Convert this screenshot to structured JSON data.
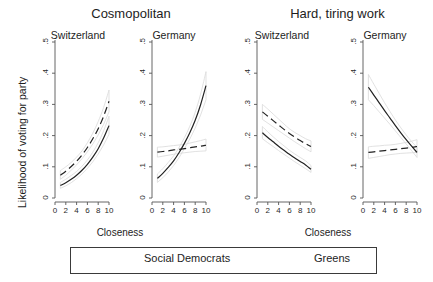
{
  "figure": {
    "ylabel": "Likelihood of voting for party",
    "xlabel": "Closeness",
    "supertitles": [
      "Cosmopolitan",
      "Hard, tiring work"
    ],
    "ytick_labels": [
      "0",
      ".1",
      ".2",
      ".3",
      ".4",
      ".5"
    ],
    "xtick_labels": [
      "0",
      "2",
      "4",
      "6",
      "8",
      "10"
    ],
    "line_color": "#222222",
    "band_color": "#d9d9d9",
    "axis_color": "#555555"
  },
  "legend": {
    "social_democrats_label": "Social Democrats",
    "greens_label": "Greens",
    "social_democrats_style": "dashed",
    "greens_style": "solid"
  },
  "panels": [
    {
      "title": "Switzerland",
      "group": "Cosmopolitan"
    },
    {
      "title": "Germany",
      "group": "Cosmopolitan"
    },
    {
      "title": "Switzerland",
      "group": "Hard, tiring work"
    },
    {
      "title": "Germany",
      "group": "Hard, tiring work"
    }
  ],
  "chart_data": {
    "type": "line",
    "xlabel": "Closeness",
    "ylabel": "Likelihood of voting for party",
    "xlim": [
      0,
      10
    ],
    "ylim": [
      0,
      0.5
    ],
    "xticks": [
      0,
      2,
      4,
      6,
      8,
      10
    ],
    "yticks": [
      0,
      0.1,
      0.2,
      0.3,
      0.4,
      0.5
    ],
    "grid": false,
    "legend_position": "bottom",
    "x": [
      1,
      2,
      3,
      4,
      5,
      6,
      7,
      8,
      9,
      10
    ],
    "panels": [
      {
        "supertitle": "Cosmopolitan",
        "title": "Switzerland",
        "series": [
          {
            "name": "Social Democrats",
            "style": "dashed",
            "values": [
              0.073,
              0.086,
              0.101,
              0.118,
              0.138,
              0.162,
              0.19,
              0.222,
              0.262,
              0.31
            ],
            "ci_lower": [
              0.06,
              0.073,
              0.089,
              0.106,
              0.126,
              0.148,
              0.173,
              0.202,
              0.236,
              0.276
            ],
            "ci_upper": [
              0.088,
              0.1,
              0.114,
              0.131,
              0.151,
              0.177,
              0.208,
              0.245,
              0.29,
              0.346
            ]
          },
          {
            "name": "Greens",
            "style": "solid",
            "values": [
              0.04,
              0.049,
              0.06,
              0.073,
              0.089,
              0.108,
              0.131,
              0.158,
              0.192,
              0.232
            ],
            "ci_lower": [
              0.031,
              0.039,
              0.049,
              0.062,
              0.077,
              0.095,
              0.116,
              0.141,
              0.17,
              0.204
            ],
            "ci_upper": [
              0.05,
              0.06,
              0.072,
              0.085,
              0.102,
              0.122,
              0.147,
              0.177,
              0.215,
              0.262
            ]
          }
        ]
      },
      {
        "supertitle": "Cosmopolitan",
        "title": "Germany",
        "series": [
          {
            "name": "Social Democrats",
            "style": "dashed",
            "values": [
              0.147,
              0.149,
              0.151,
              0.154,
              0.156,
              0.158,
              0.161,
              0.164,
              0.166,
              0.169
            ],
            "ci_lower": [
              0.131,
              0.134,
              0.137,
              0.14,
              0.143,
              0.145,
              0.147,
              0.149,
              0.15,
              0.151
            ],
            "ci_upper": [
              0.163,
              0.164,
              0.166,
              0.168,
              0.17,
              0.172,
              0.176,
              0.18,
              0.184,
              0.189
            ]
          },
          {
            "name": "Greens",
            "style": "solid",
            "values": [
              0.063,
              0.079,
              0.098,
              0.119,
              0.145,
              0.175,
              0.209,
              0.249,
              0.299,
              0.36
            ],
            "ci_lower": [
              0.05,
              0.065,
              0.083,
              0.104,
              0.129,
              0.158,
              0.189,
              0.224,
              0.266,
              0.315
            ],
            "ci_upper": [
              0.077,
              0.094,
              0.114,
              0.135,
              0.162,
              0.193,
              0.23,
              0.275,
              0.333,
              0.405
            ]
          }
        ]
      },
      {
        "supertitle": "Hard, tiring work",
        "title": "Switzerland",
        "series": [
          {
            "name": "Social Democrats",
            "style": "dashed",
            "values": [
              0.276,
              0.262,
              0.248,
              0.234,
              0.22,
              0.207,
              0.195,
              0.184,
              0.174,
              0.165
            ],
            "ci_lower": [
              0.252,
              0.24,
              0.228,
              0.216,
              0.204,
              0.192,
              0.18,
              0.169,
              0.158,
              0.148
            ],
            "ci_upper": [
              0.3,
              0.285,
              0.269,
              0.253,
              0.237,
              0.222,
              0.21,
              0.2,
              0.19,
              0.183
            ]
          },
          {
            "name": "Greens",
            "style": "solid",
            "values": [
              0.209,
              0.194,
              0.18,
              0.166,
              0.153,
              0.14,
              0.128,
              0.117,
              0.106,
              0.092
            ],
            "ci_lower": [
              0.19,
              0.177,
              0.165,
              0.152,
              0.14,
              0.128,
              0.116,
              0.105,
              0.094,
              0.082
            ],
            "ci_upper": [
              0.229,
              0.212,
              0.196,
              0.181,
              0.167,
              0.153,
              0.141,
              0.13,
              0.119,
              0.104
            ]
          }
        ]
      },
      {
        "supertitle": "Hard, tiring work",
        "title": "Germany",
        "series": [
          {
            "name": "Social Democrats",
            "style": "dashed",
            "values": [
              0.146,
              0.148,
              0.15,
              0.152,
              0.154,
              0.156,
              0.158,
              0.16,
              0.162,
              0.165
            ],
            "ci_lower": [
              0.127,
              0.13,
              0.133,
              0.136,
              0.139,
              0.141,
              0.143,
              0.144,
              0.145,
              0.146
            ],
            "ci_upper": [
              0.164,
              0.166,
              0.167,
              0.169,
              0.17,
              0.172,
              0.175,
              0.178,
              0.182,
              0.187
            ]
          },
          {
            "name": "Greens",
            "style": "solid",
            "values": [
              0.355,
              0.33,
              0.305,
              0.28,
              0.256,
              0.232,
              0.209,
              0.187,
              0.166,
              0.146
            ],
            "ci_lower": [
              0.315,
              0.296,
              0.276,
              0.256,
              0.236,
              0.215,
              0.194,
              0.173,
              0.152,
              0.13
            ],
            "ci_upper": [
              0.396,
              0.365,
              0.335,
              0.305,
              0.277,
              0.25,
              0.225,
              0.202,
              0.181,
              0.163
            ]
          }
        ]
      }
    ]
  }
}
